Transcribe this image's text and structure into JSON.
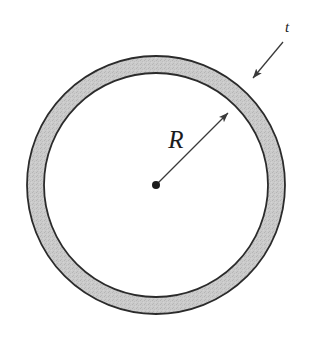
{
  "figure": {
    "background_color": "#ffffff",
    "width": 313,
    "height": 346
  },
  "ring": {
    "center": {
      "x": 156,
      "y": 185
    },
    "outer_radius": 129,
    "inner_radius": 112,
    "wall_thickness": 17,
    "fill_color": "#c9c9c9",
    "stroke_color": "#2b2b2b",
    "stroke_width": 1.8,
    "interior_color": "#ffffff"
  },
  "annotations": {
    "radius": {
      "label": "R",
      "label_x": 176,
      "label_y": 148,
      "line_from": {
        "x": 156,
        "y": 185
      },
      "line_to": {
        "x": 228,
        "y": 113
      },
      "color": "#3a3a3a"
    },
    "thickness": {
      "label": "t",
      "label_x": 287,
      "label_y": 32,
      "line_from": {
        "x": 283,
        "y": 42
      },
      "line_to": {
        "x": 253,
        "y": 78
      },
      "color": "#3a3a3a"
    },
    "center_point": {
      "x": 156,
      "y": 185,
      "radius": 4,
      "color": "#1c1c1c"
    }
  }
}
